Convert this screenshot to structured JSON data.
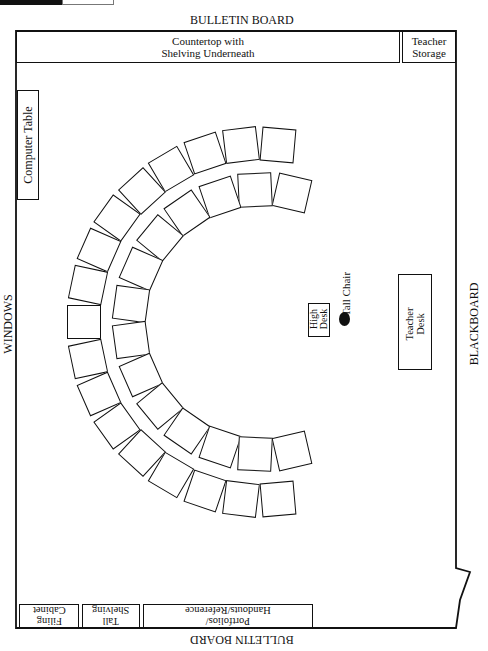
{
  "walls": {
    "top": "BULLETIN BOARD",
    "bottom": "BULLETIN BOARD",
    "left": "WINDOWS",
    "right": "BLACKBOARD"
  },
  "furniture": {
    "countertop": {
      "line1": "Countertop with",
      "line2": "Shelving Underneath"
    },
    "teacher_storage": {
      "line1": "Teacher",
      "line2": "Storage"
    },
    "computer_table": "Computer Table",
    "high_desk": {
      "line1": "High",
      "line2": "Desk"
    },
    "tall_chair": "Tall Chair",
    "teacher_desk": {
      "line1": "Teacher",
      "line2": "Desk"
    },
    "portfolios": {
      "line1": "Portfolios/",
      "line2": "Handouts/Reference"
    },
    "tall_shelving": {
      "line1": "Tall",
      "line2": "Shelving"
    },
    "filing_cabinet": {
      "line1": "Filing",
      "line2": "Cabinet"
    }
  },
  "student_desks": {
    "outer_ring_count": 17,
    "inner_ring_count": 14
  }
}
